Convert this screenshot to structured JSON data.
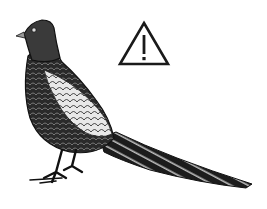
{
  "scene": {
    "subject": "pheasant illustration",
    "style": "black and white engraving",
    "background_color": "#ffffff",
    "ink_color": "#1a1a1a"
  },
  "icons": {
    "warning": {
      "name": "warning-triangle-icon",
      "glyph": "!"
    }
  }
}
